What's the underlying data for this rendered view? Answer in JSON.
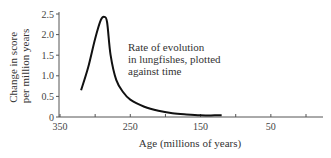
{
  "chart_data": {
    "type": "line",
    "title": "",
    "annotation": [
      "Rate of evolution",
      "in lungfishes, plotted",
      "against time"
    ],
    "xlabel": "Age (millions of years)",
    "ylabel": [
      "Change in score",
      "per million years"
    ],
    "xlim": [
      350,
      0
    ],
    "ylim": [
      0,
      2.5
    ],
    "x_ticks": [
      350,
      300,
      250,
      200,
      150,
      100,
      50,
      0
    ],
    "x_tick_labels": [
      "350",
      "250",
      "150",
      "50"
    ],
    "y_ticks": [
      0,
      0.5,
      1.0,
      1.5,
      2.0,
      2.5
    ],
    "y_tick_labels": [
      "0",
      "0.5",
      "1.0",
      "1.5",
      "2.0",
      "2.5"
    ],
    "grid": false,
    "series": [
      {
        "name": "Rate of evolution in lungfishes",
        "x": [
          320,
          310,
          300,
          292,
          287,
          283,
          278,
          270,
          260,
          250,
          230,
          210,
          190,
          170,
          150,
          130,
          120
        ],
        "values": [
          0.65,
          1.2,
          1.9,
          2.35,
          2.43,
          2.3,
          1.5,
          0.9,
          0.6,
          0.42,
          0.25,
          0.15,
          0.09,
          0.06,
          0.04,
          0.04,
          0.04
        ]
      }
    ]
  }
}
